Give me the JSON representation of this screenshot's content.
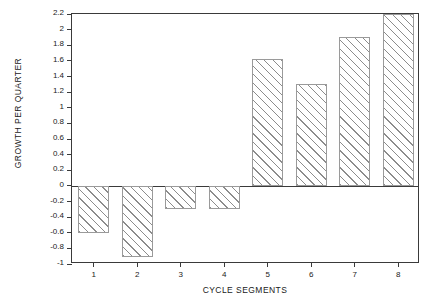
{
  "chart_data": {
    "type": "bar",
    "title": "",
    "xlabel": "CYCLE SEGMENTS",
    "ylabel": "GROWTH PER QUARTER",
    "categories": [
      "1",
      "2",
      "3",
      "4",
      "5",
      "6",
      "7",
      "8"
    ],
    "values": [
      -0.6,
      -0.91,
      -0.3,
      -0.3,
      1.62,
      1.3,
      1.9,
      2.2
    ],
    "ylim": [
      -1,
      2.2
    ],
    "xlim": [
      0.5,
      8.5
    ],
    "ytick_labels": [
      "2.2",
      "2",
      "1.8",
      "1.6",
      "1.4",
      "1.2",
      "1",
      "0.8",
      "0.6",
      "0.4",
      "0.2",
      "0",
      "-0.2",
      "-0.4",
      "-0.6",
      "-0.8",
      "-1"
    ],
    "ytick_values": [
      2.2,
      2,
      1.8,
      1.6,
      1.4,
      1.2,
      1,
      0.8,
      0.6,
      0.4,
      0.2,
      0,
      -0.2,
      -0.4,
      -0.6,
      -0.8,
      -1
    ],
    "grid": false,
    "legend": null,
    "bar_fill": "hatched-diagonal",
    "bar_edge_color": "#9a9a9a",
    "axis_color": "#3a3a3a",
    "background": "#ffffff"
  }
}
